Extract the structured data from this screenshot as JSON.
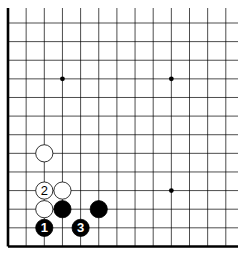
{
  "diagram": {
    "type": "go-board-partial",
    "grid": {
      "x0": 8,
      "dx": 18.15,
      "cols": 13,
      "x_end": 238,
      "y0": 23,
      "dy": 18.62,
      "rows": 13,
      "y_top": 8,
      "line_color": "#000000",
      "edge_left": true,
      "edge_bottom": true
    },
    "star_points": [
      {
        "col": 3,
        "row": 3
      },
      {
        "col": 9,
        "row": 3
      },
      {
        "col": 9,
        "row": 9
      }
    ],
    "stones": [
      {
        "color": "white",
        "col": 2,
        "row": 7,
        "label": ""
      },
      {
        "color": "white",
        "col": 2,
        "row": 9,
        "label": "2"
      },
      {
        "color": "white",
        "col": 3,
        "row": 9,
        "label": ""
      },
      {
        "color": "white",
        "col": 2,
        "row": 10,
        "label": ""
      },
      {
        "color": "black",
        "col": 3,
        "row": 10,
        "label": ""
      },
      {
        "color": "black",
        "col": 5,
        "row": 10,
        "label": ""
      },
      {
        "color": "black",
        "col": 2,
        "row": 11,
        "label": "1"
      },
      {
        "color": "black",
        "col": 4,
        "row": 11,
        "label": "3"
      }
    ],
    "colors": {
      "black": "#000000",
      "white": "#ffffff",
      "background": "#ffffff"
    }
  }
}
